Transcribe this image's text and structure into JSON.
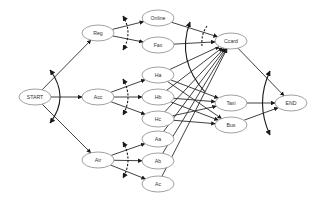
{
  "diagram": {
    "type": "and-or-workflow-graph",
    "colors": {
      "node_stroke": "#8a8a8a",
      "edge": "#2a2a2a",
      "background": "#ffffff"
    },
    "nodes": [
      {
        "id": "START",
        "label": "START",
        "x": 35,
        "y": 97
      },
      {
        "id": "Reg",
        "label": "Reg",
        "x": 98,
        "y": 33
      },
      {
        "id": "Acc",
        "label": "Acc",
        "x": 98,
        "y": 97
      },
      {
        "id": "Air",
        "label": "Air",
        "x": 98,
        "y": 160
      },
      {
        "id": "Online",
        "label": "Online",
        "x": 158,
        "y": 18
      },
      {
        "id": "Fax",
        "label": "Fax",
        "x": 158,
        "y": 45
      },
      {
        "id": "Ha",
        "label": "Ha",
        "x": 158,
        "y": 75
      },
      {
        "id": "Hb",
        "label": "Hb",
        "x": 158,
        "y": 97
      },
      {
        "id": "Hc",
        "label": "Hc",
        "x": 158,
        "y": 119
      },
      {
        "id": "Aa",
        "label": "Aa",
        "x": 158,
        "y": 139
      },
      {
        "id": "Ab",
        "label": "Ab",
        "x": 158,
        "y": 161
      },
      {
        "id": "Ac",
        "label": "Ac",
        "x": 158,
        "y": 184
      },
      {
        "id": "Ccard",
        "label": "Ccard",
        "x": 231,
        "y": 41
      },
      {
        "id": "Taxi",
        "label": "Taxi",
        "x": 231,
        "y": 103
      },
      {
        "id": "Bus",
        "label": "Bus",
        "x": 231,
        "y": 125
      },
      {
        "id": "END",
        "label": "END",
        "x": 291,
        "y": 103
      }
    ],
    "edges": [
      [
        "START",
        "Reg"
      ],
      [
        "START",
        "Acc"
      ],
      [
        "START",
        "Air"
      ],
      [
        "Reg",
        "Online"
      ],
      [
        "Reg",
        "Fax"
      ],
      [
        "Acc",
        "Ha"
      ],
      [
        "Acc",
        "Hb"
      ],
      [
        "Acc",
        "Hc"
      ],
      [
        "Air",
        "Aa"
      ],
      [
        "Air",
        "Ab"
      ],
      [
        "Air",
        "Ac"
      ],
      [
        "Online",
        "Ccard"
      ],
      [
        "Fax",
        "Ccard"
      ],
      [
        "Ha",
        "Ccard"
      ],
      [
        "Hb",
        "Ccard"
      ],
      [
        "Hc",
        "Ccard"
      ],
      [
        "Aa",
        "Ccard"
      ],
      [
        "Ab",
        "Ccard"
      ],
      [
        "Ac",
        "Ccard"
      ],
      [
        "Ha",
        "Taxi"
      ],
      [
        "Hb",
        "Taxi"
      ],
      [
        "Hc",
        "Taxi"
      ],
      [
        "Ha",
        "Bus"
      ],
      [
        "Hb",
        "Bus"
      ],
      [
        "Hc",
        "Bus"
      ],
      [
        "Ccard",
        "END"
      ],
      [
        "Taxi",
        "END"
      ],
      [
        "Bus",
        "END"
      ]
    ],
    "split_types": {
      "START": "AND",
      "Reg": "XOR",
      "Acc": "XOR",
      "Air": "XOR"
    },
    "join_types": {
      "Ccard": "OR",
      "END": "AND"
    }
  }
}
